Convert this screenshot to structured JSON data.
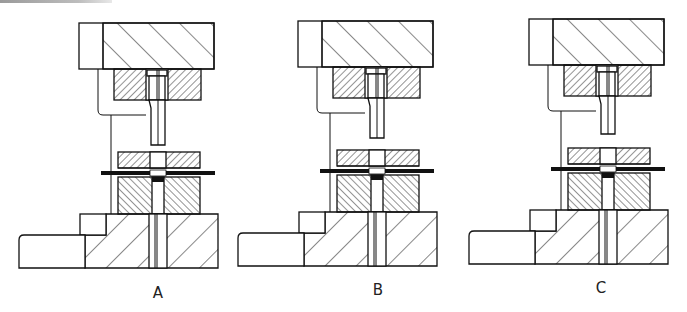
{
  "figure": {
    "panels": [
      {
        "id": "A",
        "label": "A",
        "dx": 0,
        "dy": 0,
        "punch_tip_y": 145,
        "label_x": 158,
        "label_y": 298
      },
      {
        "id": "B",
        "label": "B",
        "dx": 219,
        "dy": -2,
        "punch_tip_y": 140,
        "label_x": 378,
        "label_y": 295
      },
      {
        "id": "C",
        "label": "C",
        "dx": 450,
        "dy": -4,
        "punch_tip_y": 138,
        "label_x": 601,
        "label_y": 293
      }
    ],
    "parts": [
      "upper-die-shoe",
      "punch-plate",
      "punch",
      "stripper-plate",
      "strip-stock",
      "die-block",
      "lower-die-shoe",
      "base"
    ],
    "colors": {
      "line": "#111111",
      "background": "#ffffff"
    }
  }
}
